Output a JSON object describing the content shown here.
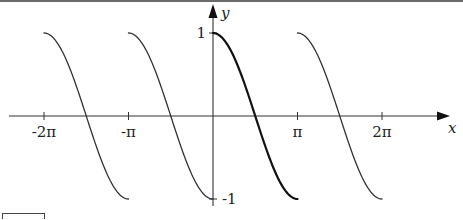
{
  "chart_data": {
    "type": "line",
    "title": "",
    "xlabel": "x",
    "ylabel": "y",
    "x_ticks": [
      {
        "value": -6.2832,
        "label": "-2π"
      },
      {
        "value": -3.1416,
        "label": "-π"
      },
      {
        "value": 3.1416,
        "label": "π"
      },
      {
        "value": 6.2832,
        "label": "2π"
      }
    ],
    "y_ticks": [
      {
        "value": 1,
        "label": "1"
      },
      {
        "value": -1,
        "label": "-1"
      }
    ],
    "xlim": [
      -7.6,
      8.8
    ],
    "ylim": [
      -1.15,
      1.35
    ],
    "grid": false,
    "legend": null,
    "function": "cos(x - kπ) on [kπ, (k+1)π]  (π-periodic extension of cos restricted to [0,π])",
    "series": [
      {
        "name": "segment k=-2",
        "domain": [
          -6.2832,
          -3.1416
        ],
        "emphasis": false
      },
      {
        "name": "segment k=-1",
        "domain": [
          -3.1416,
          0
        ],
        "emphasis": false
      },
      {
        "name": "segment k=0 (principal)",
        "domain": [
          0,
          3.1416
        ],
        "emphasis": true
      },
      {
        "name": "segment k=1",
        "domain": [
          3.1416,
          6.2832
        ],
        "emphasis": false
      }
    ],
    "sample_points": {
      "x_offset_from_segment_start": [
        0,
        0.7854,
        1.5708,
        2.3562,
        3.1416
      ],
      "y": [
        1,
        0.7071,
        0,
        -0.7071,
        -1
      ]
    }
  },
  "colors": {
    "curve": "#333333",
    "curve_emphasis": "#111111",
    "axis": "#333333",
    "frame": "#555555"
  }
}
